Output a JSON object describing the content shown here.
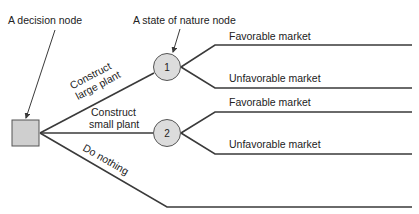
{
  "diagram": {
    "type": "decision-tree",
    "colors": {
      "line": "#3a3a3a",
      "node_fill": "#cfcfcf",
      "node_stroke": "#555555",
      "text": "#222222"
    },
    "annotations": {
      "decision_node": "A decision node",
      "state_of_nature_node": "A state of nature node"
    },
    "decision_node": {
      "shape": "square"
    },
    "alternatives": [
      {
        "label_line1": "Construct",
        "label_line2": "large plant",
        "node": "1"
      },
      {
        "label_line1": "Construct",
        "label_line2": "small plant",
        "node": "2"
      },
      {
        "label_line1": "Do nothing"
      }
    ],
    "outcomes": {
      "node1": [
        "Favorable market",
        "Unfavorable market"
      ],
      "node2": [
        "Favorable market",
        "Unfavorable market"
      ]
    }
  }
}
